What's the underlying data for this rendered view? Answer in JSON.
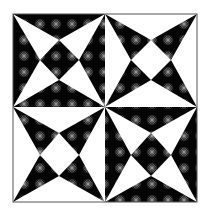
{
  "image": {
    "subject": "quilt-block-pattern",
    "layout": "2x2 blocks",
    "colors": {
      "dark": "#050505",
      "light": "#ffffff",
      "star": "#9a9a9a",
      "border": "#333333"
    },
    "blocks": [
      {
        "position": "top-left",
        "background": "dark",
        "points": "light"
      },
      {
        "position": "top-right",
        "background": "light",
        "points": "dark"
      },
      {
        "position": "bottom-left",
        "background": "light",
        "points": "dark"
      },
      {
        "position": "bottom-right",
        "background": "dark",
        "points": "light"
      }
    ]
  }
}
